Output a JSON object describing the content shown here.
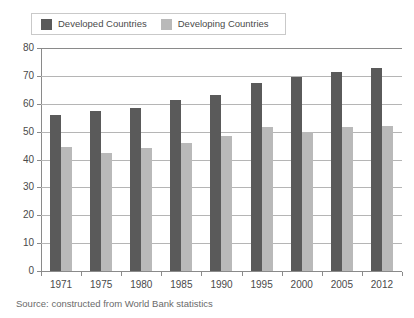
{
  "chart_data": {
    "type": "bar",
    "title": "",
    "xlabel": "",
    "ylabel": "",
    "ylim": [
      0,
      80
    ],
    "yticks": [
      0,
      10,
      20,
      30,
      40,
      50,
      60,
      70,
      80
    ],
    "grid": true,
    "legend_position": "top-left",
    "categories": [
      "1971",
      "1975",
      "1980",
      "1985",
      "1990",
      "1995",
      "2000",
      "2005",
      "2012"
    ],
    "series": [
      {
        "name": "Developed Countries",
        "color": "#5a5a5a",
        "values": [
          56,
          57.5,
          58.5,
          61.5,
          63,
          67.5,
          69.5,
          71.5,
          73
        ]
      },
      {
        "name": "Developing Countries",
        "color": "#b9b9b9",
        "values": [
          44.5,
          42.5,
          44,
          46,
          48.5,
          51.5,
          50,
          51.5,
          52
        ]
      }
    ]
  },
  "legend": {
    "entries": [
      {
        "label": "Developed Countries",
        "swatch": "legend-swatch-developed"
      },
      {
        "label": "Developing Countries",
        "swatch": "legend-swatch-developing"
      }
    ]
  },
  "source": {
    "text": "Source: constructed from World Bank statistics"
  }
}
